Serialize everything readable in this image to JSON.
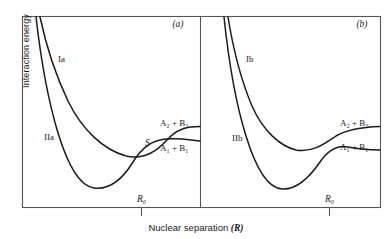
{
  "figure": {
    "axis": {
      "ylabel": "Interaction energy",
      "xlabel_text": "Nuclear separation",
      "xlabel_symbol": "(R)"
    },
    "panels": [
      {
        "id": "a",
        "tag": "(a)",
        "curves": [
          {
            "name": "upper-repulsive",
            "label": "Ia"
          },
          {
            "name": "lower-bound",
            "label": "IIa"
          }
        ],
        "crossing_label": "S",
        "crossing_type": "diabatic-crossing",
        "asymptotes": [
          {
            "label": "A₂ + B₂",
            "level": "upper"
          },
          {
            "label": "A₁ + B₁",
            "level": "lower"
          }
        ],
        "equilibrium_tick": "R₀"
      },
      {
        "id": "b",
        "tag": "(b)",
        "curves": [
          {
            "name": "upper-repulsive",
            "label": "Ib"
          },
          {
            "name": "lower-bound",
            "label": "IIb"
          }
        ],
        "crossing_label": "",
        "crossing_type": "avoided-crossing",
        "asymptotes": [
          {
            "label": "A₂ + B₂",
            "level": "upper"
          },
          {
            "label": "A₁ + B₁",
            "level": "lower"
          }
        ],
        "equilibrium_tick": "R₀"
      }
    ],
    "colors": {
      "ink": "#1a1a1a",
      "frame": "#555555",
      "background": "#ffffff"
    }
  }
}
